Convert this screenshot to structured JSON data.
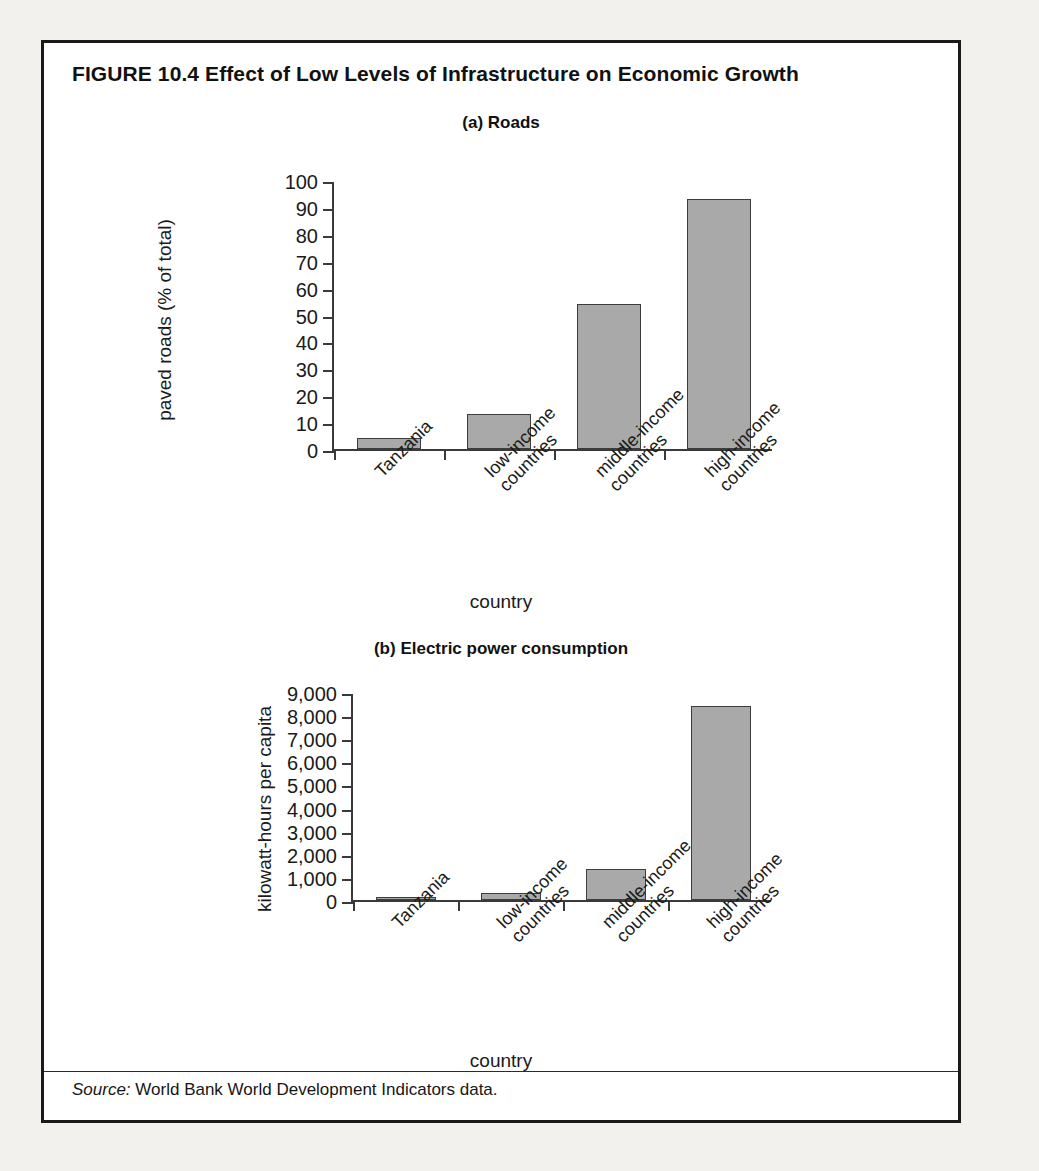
{
  "figure": {
    "title": "FIGURE 10.4  Effect of Low Levels of Infrastructure on Economic Growth",
    "source_label": "Source:",
    "source_text": " World Bank World Development Indicators data."
  },
  "chart_data": [
    {
      "type": "bar",
      "title": "(a) Roads",
      "categories": [
        "Tanzania",
        "low-income\ncountries",
        "middle-income\ncountries",
        "high-income\ncountries"
      ],
      "category_lines": [
        [
          "Tanzania"
        ],
        [
          "low-income",
          "countries"
        ],
        [
          "middle-income",
          "countries"
        ],
        [
          "high-income",
          "countries"
        ]
      ],
      "values": [
        4,
        13,
        54,
        93
      ],
      "xlabel": "country",
      "ylabel": "paved roads (% of total)",
      "ylim": [
        0,
        100
      ],
      "yticks": [
        0,
        10,
        20,
        30,
        40,
        50,
        60,
        70,
        80,
        90,
        100
      ],
      "ytick_labels": [
        "0",
        "10",
        "20",
        "30",
        "40",
        "50",
        "60",
        "70",
        "80",
        "90",
        "100"
      ],
      "grid": false,
      "legend": "none",
      "bar_fill": "#a9a9a9",
      "bar_stroke": "#3d3d3d"
    },
    {
      "type": "bar",
      "title": "(b) Electric power consumption",
      "categories": [
        "Tanzania",
        "low-income\ncountries",
        "middle-income\ncountries",
        "high-income\ncountries"
      ],
      "category_lines": [
        [
          "Tanzania"
        ],
        [
          "low-income",
          "countries"
        ],
        [
          "middle-income",
          "countries"
        ],
        [
          "high-income",
          "countries"
        ]
      ],
      "values": [
        60,
        300,
        1350,
        8400
      ],
      "xlabel": "country",
      "ylabel": "kilowatt-hours per capita",
      "ylim": [
        0,
        9000
      ],
      "yticks": [
        0,
        1000,
        2000,
        3000,
        4000,
        5000,
        6000,
        7000,
        8000,
        9000
      ],
      "ytick_labels": [
        "0",
        "1,000",
        "2,000",
        "3,000",
        "4,000",
        "5,000",
        "6,000",
        "7,000",
        "8,000",
        "9,000"
      ],
      "grid": false,
      "legend": "none",
      "bar_fill": "#a9a9a9",
      "bar_stroke": "#3d3d3d"
    }
  ]
}
